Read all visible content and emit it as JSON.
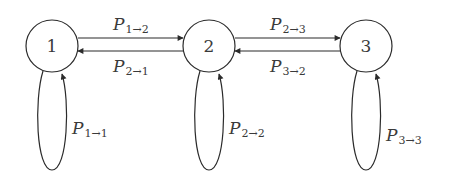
{
  "diagram": {
    "type": "markov-chain-state-diagram",
    "states": [
      {
        "id": "1",
        "label": "1"
      },
      {
        "id": "2",
        "label": "2"
      },
      {
        "id": "3",
        "label": "3"
      }
    ],
    "transitions": [
      {
        "from": "1",
        "to": "2",
        "symbol": "P",
        "subscript": "1→2"
      },
      {
        "from": "2",
        "to": "1",
        "symbol": "P",
        "subscript": "2→1"
      },
      {
        "from": "2",
        "to": "3",
        "symbol": "P",
        "subscript": "2→3"
      },
      {
        "from": "3",
        "to": "2",
        "symbol": "P",
        "subscript": "3→2"
      },
      {
        "from": "1",
        "to": "1",
        "symbol": "P",
        "subscript": "1→1"
      },
      {
        "from": "2",
        "to": "2",
        "symbol": "P",
        "subscript": "2→2"
      },
      {
        "from": "3",
        "to": "3",
        "symbol": "P",
        "subscript": "3→3"
      }
    ],
    "colors": {
      "stroke": "#2b2b2b",
      "text": "#3a3a3a",
      "background": "#ffffff"
    }
  }
}
